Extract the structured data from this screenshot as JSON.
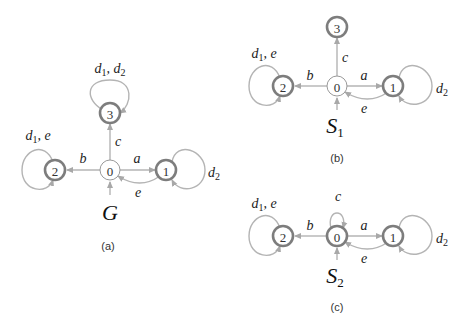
{
  "figures": [
    {
      "id": "a",
      "caption": "(a)",
      "automaton": {
        "name": "G",
        "subscript": ""
      },
      "nodes": [
        {
          "id": "0",
          "label": "0",
          "marked": false,
          "initial": true
        },
        {
          "id": "1",
          "label": "1",
          "marked": true
        },
        {
          "id": "2",
          "label": "2",
          "marked": true
        },
        {
          "id": "3",
          "label": "3",
          "marked": true
        }
      ],
      "edges": [
        {
          "from": "0",
          "to": "1",
          "label": "a"
        },
        {
          "from": "0",
          "to": "2",
          "label": "b"
        },
        {
          "from": "0",
          "to": "3",
          "label": "c"
        },
        {
          "from": "1",
          "to": "0",
          "label": "e"
        },
        {
          "from": "1",
          "to": "1",
          "label": "d2"
        },
        {
          "from": "2",
          "to": "2",
          "label": "d1, e"
        },
        {
          "from": "3",
          "to": "3",
          "label": "d1, d2"
        }
      ],
      "labels": {
        "a": "a",
        "b": "b",
        "c": "c",
        "e": "e",
        "self1_main": "d",
        "self1_sub": "2",
        "self2_main1": "d",
        "self2_sub1": "1",
        "self2_rest": ", e",
        "self3_main1": "d",
        "self3_sub1": "1",
        "self3_mid": ", d",
        "self3_sub2": "2"
      }
    },
    {
      "id": "b",
      "caption": "(b)",
      "automaton": {
        "name": "S",
        "subscript": "1"
      },
      "nodes": [
        {
          "id": "0",
          "label": "0",
          "marked": false,
          "initial": true
        },
        {
          "id": "1",
          "label": "1",
          "marked": true
        },
        {
          "id": "2",
          "label": "2",
          "marked": true
        },
        {
          "id": "3",
          "label": "3",
          "marked": true
        }
      ],
      "edges": [
        {
          "from": "0",
          "to": "1",
          "label": "a"
        },
        {
          "from": "0",
          "to": "2",
          "label": "b"
        },
        {
          "from": "0",
          "to": "3",
          "label": "c"
        },
        {
          "from": "1",
          "to": "0",
          "label": "e"
        },
        {
          "from": "1",
          "to": "1",
          "label": "d2"
        },
        {
          "from": "2",
          "to": "2",
          "label": "d1, e"
        }
      ],
      "labels": {
        "a": "a",
        "b": "b",
        "c": "c",
        "e": "e",
        "self1_main": "d",
        "self1_sub": "2",
        "self2_main1": "d",
        "self2_sub1": "1",
        "self2_rest": ", e"
      }
    },
    {
      "id": "c",
      "caption": "(c)",
      "automaton": {
        "name": "S",
        "subscript": "2"
      },
      "nodes": [
        {
          "id": "0",
          "label": "0",
          "marked": true,
          "initial": true
        },
        {
          "id": "1",
          "label": "1",
          "marked": true
        },
        {
          "id": "2",
          "label": "2",
          "marked": true
        }
      ],
      "edges": [
        {
          "from": "0",
          "to": "1",
          "label": "a"
        },
        {
          "from": "0",
          "to": "2",
          "label": "b"
        },
        {
          "from": "0",
          "to": "0",
          "label": "c"
        },
        {
          "from": "1",
          "to": "0",
          "label": "e"
        },
        {
          "from": "1",
          "to": "1",
          "label": "d2"
        },
        {
          "from": "2",
          "to": "2",
          "label": "d1, e"
        }
      ],
      "labels": {
        "a": "a",
        "b": "b",
        "c": "c",
        "e": "e",
        "self1_main": "d",
        "self1_sub": "2",
        "self2_main1": "d",
        "self2_sub1": "1",
        "self2_rest": ", e"
      }
    }
  ]
}
